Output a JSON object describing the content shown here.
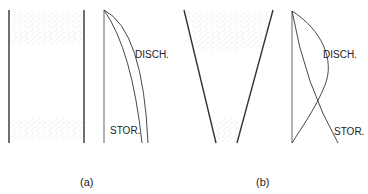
{
  "panels": [
    {
      "id": "a",
      "caption": "(a)",
      "vessel_shape": "cylindrical",
      "curve_labels": {
        "discharge": "DISCH.",
        "storage": "STOR."
      }
    },
    {
      "id": "b",
      "caption": "(b)",
      "vessel_shape": "conical",
      "curve_labels": {
        "discharge": "DISCH.",
        "storage": "STOR."
      }
    }
  ],
  "colors": {
    "line": "#333333",
    "stipple": "#b8b8b8",
    "background": "#ffffff"
  }
}
